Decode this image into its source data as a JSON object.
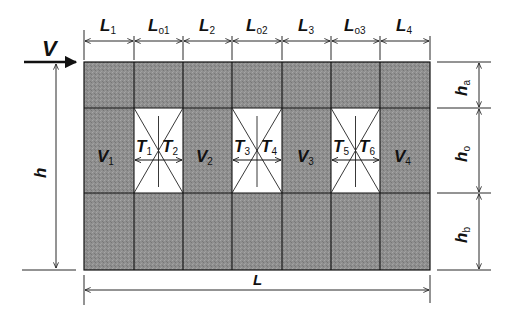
{
  "diagram": {
    "load": {
      "label": "V"
    },
    "top_dimensions": [
      {
        "main": "L",
        "sub": "1"
      },
      {
        "main": "L",
        "sub": "o1"
      },
      {
        "main": "L",
        "sub": "2"
      },
      {
        "main": "L",
        "sub": "o2"
      },
      {
        "main": "L",
        "sub": "3"
      },
      {
        "main": "L",
        "sub": "o3"
      },
      {
        "main": "L",
        "sub": "4"
      }
    ],
    "right_dimensions": [
      {
        "main": "h",
        "sub": "a"
      },
      {
        "main": "h",
        "sub": "o"
      },
      {
        "main": "h",
        "sub": "b"
      }
    ],
    "left_dimension": {
      "main": "h"
    },
    "bottom_dimension": {
      "main": "L"
    },
    "piers": [
      {
        "main": "V",
        "sub": "1"
      },
      {
        "main": "V",
        "sub": "2"
      },
      {
        "main": "V",
        "sub": "3"
      },
      {
        "main": "V",
        "sub": "4"
      }
    ],
    "openings": [
      {
        "left": {
          "main": "T",
          "sub": "1"
        },
        "right": {
          "main": "T",
          "sub": "2"
        }
      },
      {
        "left": {
          "main": "T",
          "sub": "3"
        },
        "right": {
          "main": "T",
          "sub": "4"
        }
      },
      {
        "left": {
          "main": "T",
          "sub": "5"
        },
        "right": {
          "main": "T",
          "sub": "6"
        }
      }
    ],
    "colors": {
      "masonry": "#8f8f8f",
      "opening": "#ffffff",
      "line": "#111111"
    }
  }
}
